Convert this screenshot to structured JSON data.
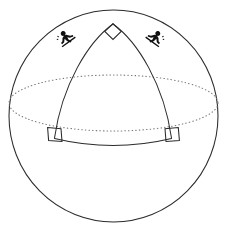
{
  "figure": {
    "caption": "",
    "background_color": "#ffffff",
    "stroke_color": "#2b2b2b",
    "hidden_line_color": "#777777",
    "silhouette_color": "#111111"
  },
  "geometry": {
    "canvas": {
      "width": 227,
      "height": 230
    },
    "sphere": {
      "name": "sphere-outline",
      "center_x": 113.5,
      "center_y": 116,
      "radius_x": 104.5,
      "radius_y": 106
    },
    "equator": {
      "name": "equator-ellipse",
      "center_x": 113.5,
      "center_y": 103,
      "radius_x": 104.5,
      "radius_y": 28,
      "style": "dotted",
      "label": "equator (great circle, hidden behind sphere)"
    },
    "triangle": {
      "name": "spherical-triangle",
      "apex": {
        "x": 113,
        "y": 24,
        "label": "north pole vertex"
      },
      "base_left": {
        "x": 54,
        "y": 138,
        "label": "left equator vertex"
      },
      "base_right": {
        "x": 172,
        "y": 138,
        "label": "right equator vertex"
      },
      "arcs": [
        {
          "name": "left-meridian-arc",
          "path": "M 113 24 C 88 42 62 85 54 138"
        },
        {
          "name": "right-meridian-arc",
          "path": "M 113 24 C 138 42 164 85 172 138"
        },
        {
          "name": "base-arc",
          "path": "M 54 138 Q 113 152 172 138"
        }
      ],
      "angles": [
        {
          "name": "apex-right-angle",
          "vertex": "apex",
          "measure_degrees": 90,
          "marker": "diamond"
        },
        {
          "name": "base-left-right-angle",
          "vertex": "base_left",
          "measure_degrees": 90,
          "marker": "square"
        },
        {
          "name": "base-right-right-angle",
          "vertex": "base_right",
          "measure_degrees": 90,
          "marker": "square"
        }
      ],
      "angle_sum_degrees": 270
    },
    "figures": [
      {
        "name": "hiker-figure-left",
        "x": 66,
        "y": 39,
        "facing": "right",
        "rotation_degrees": -36
      },
      {
        "name": "hiker-figure-right",
        "x": 155,
        "y": 39,
        "facing": "left",
        "rotation_degrees": 36
      }
    ]
  }
}
